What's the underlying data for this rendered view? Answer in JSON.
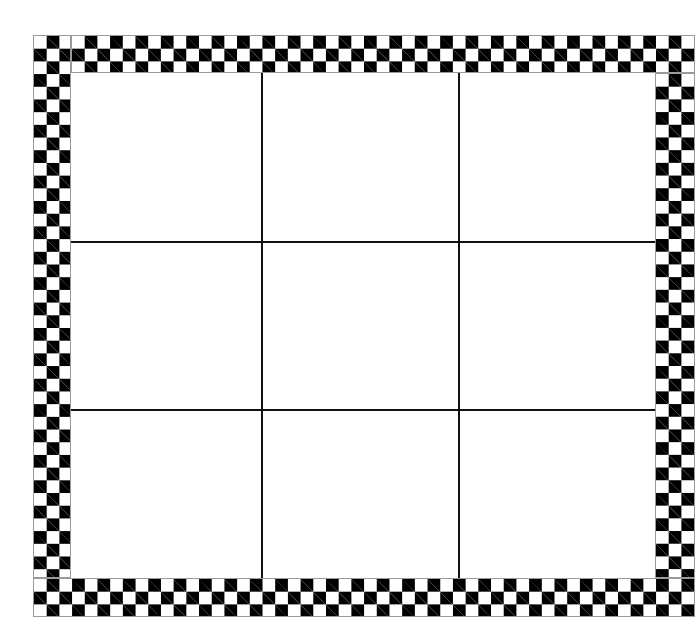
{
  "game": {
    "type": "tic-tac-toe",
    "board_size": 3,
    "cells": [
      "",
      "",
      "",
      "",
      "",
      "",
      "",
      "",
      ""
    ]
  },
  "style": {
    "border_pattern": "checkered",
    "border_colors": [
      "#000000",
      "#ffffff"
    ],
    "grid_line_color": "#111111",
    "background": "#ffffff"
  }
}
